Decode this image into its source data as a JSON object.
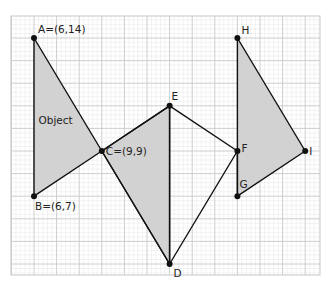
{
  "diagram": {
    "type": "coordinate-geometry-reflection",
    "grid": {
      "x_min": 5,
      "x_max": 19,
      "y_min": 2,
      "y_max": 15,
      "origin_px": [
        34,
        38
      ],
      "origin_unit": [
        6,
        14
      ],
      "px_per_unit": 22.6,
      "minor_per_major": 5,
      "major_color": "#c8c8c8",
      "minor_color": "#e6e6e6",
      "area_px": {
        "left": 11,
        "top": 16,
        "right": 320,
        "bottom": 275
      }
    },
    "colors": {
      "fill": "#d2d2d2",
      "stroke": "#111111",
      "point": "#111111"
    },
    "points": [
      {
        "id": "A",
        "label": "A=(6,14)",
        "x": 6,
        "y": 14,
        "label_dx": 4,
        "label_dy": -5
      },
      {
        "id": "B",
        "label": "B=(6,7)",
        "x": 6,
        "y": 7,
        "label_dx": 1,
        "label_dy": 14
      },
      {
        "id": "C",
        "label": "C=(9,9)",
        "x": 9,
        "y": 9,
        "label_dx": 4,
        "label_dy": 4
      },
      {
        "id": "D",
        "label": "D",
        "x": 12,
        "y": 4,
        "label_dx": 4,
        "label_dy": 13
      },
      {
        "id": "E",
        "label": "E",
        "x": 12,
        "y": 11,
        "label_dx": 2,
        "label_dy": -6
      },
      {
        "id": "F",
        "label": "F",
        "x": 15,
        "y": 9,
        "label_dx": 4,
        "label_dy": 1
      },
      {
        "id": "G",
        "label": "G",
        "x": 15,
        "y": 7,
        "label_dx": 2,
        "label_dy": -8
      },
      {
        "id": "H",
        "label": "H",
        "x": 15,
        "y": 14,
        "label_dx": 4,
        "label_dy": -4
      },
      {
        "id": "I",
        "label": "I",
        "x": 18,
        "y": 9,
        "label_dx": 4,
        "label_dy": 4
      }
    ],
    "shapes": [
      {
        "name": "object-triangle",
        "vertices": [
          "A",
          "B",
          "C"
        ],
        "label": "Object",
        "label_pos": [
          6.2,
          10.2
        ]
      },
      {
        "name": "image-triangle-1",
        "vertices": [
          "C",
          "E",
          "D"
        ]
      },
      {
        "name": "image-triangle-2",
        "vertices": [
          "H",
          "I",
          "G"
        ]
      }
    ],
    "segments": [
      [
        "C",
        "E"
      ],
      [
        "E",
        "F"
      ],
      [
        "F",
        "D"
      ],
      [
        "E",
        "D"
      ],
      [
        "C",
        "D"
      ],
      [
        "F",
        "G"
      ]
    ]
  }
}
